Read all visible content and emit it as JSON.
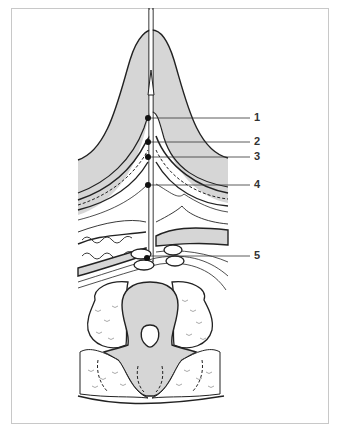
{
  "figure": {
    "fill_color": "#d6d6d6",
    "line_color": "#222222",
    "frame_color": "#c8c8c8"
  },
  "labels": [
    {
      "id": "1",
      "text": "1"
    },
    {
      "id": "2",
      "text": "2"
    },
    {
      "id": "3",
      "text": "3"
    },
    {
      "id": "4",
      "text": "4"
    },
    {
      "id": "5",
      "text": "5"
    }
  ]
}
